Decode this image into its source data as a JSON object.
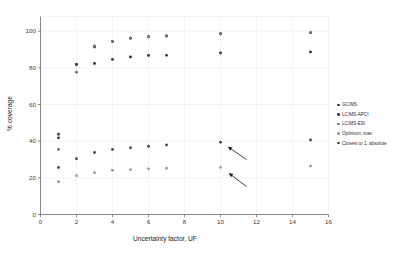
{
  "chart_data": {
    "type": "scatter",
    "title": "",
    "xlabel": "Uncertainty factor, UF",
    "ylabel": "% coverage",
    "xlim": [
      0,
      16
    ],
    "ylim": [
      0,
      108
    ],
    "xticks": [
      0,
      2,
      4,
      6,
      8,
      10,
      12,
      14,
      16
    ],
    "yticks": [
      0,
      20,
      40,
      60,
      80,
      100
    ],
    "grid": true,
    "legend_position": "right",
    "series": [
      {
        "name": "GC/MS",
        "color": "#333333",
        "marker": "circle",
        "x": [
          1,
          2,
          3,
          4,
          5,
          6,
          7,
          10,
          15
        ],
        "y": [
          41.8,
          81.8,
          82.4,
          84.6,
          85.9,
          86.7,
          86.8,
          88.1,
          88.7
        ]
      },
      {
        "name": "LC/MS-APCI",
        "color": "#3d3d3d",
        "marker": "circle",
        "x": [
          1,
          2,
          3,
          4,
          5,
          6,
          7,
          10,
          15
        ],
        "y": [
          43.8,
          81.9,
          91.4,
          94.4,
          96.1,
          97.0,
          97.4,
          98.6,
          99.2
        ]
      },
      {
        "name": "LC/MS-ESI",
        "color": "#6f6f6f",
        "marker": "circle",
        "x": [
          1,
          2,
          3,
          4,
          5,
          6,
          7,
          10,
          15
        ],
        "y": [
          35.5,
          77.6,
          91.9,
          94.4,
          96.1,
          97.0,
          97.4,
          98.6,
          99.2
        ]
      },
      {
        "name": "Optimum, max",
        "color": "#9a9a9a",
        "marker": "circle",
        "x": [
          1,
          2,
          3,
          4,
          5,
          6,
          7,
          10,
          15
        ],
        "y": [
          17.9,
          21.2,
          22.8,
          24.1,
          24.5,
          24.9,
          25.2,
          25.7,
          26.4
        ]
      },
      {
        "name": "Closest to 1, absolute",
        "color": "#4a4a4a",
        "marker": "circle",
        "x": [
          1,
          2,
          3,
          4,
          5,
          6,
          7,
          10,
          15
        ],
        "y": [
          25.6,
          30.4,
          33.8,
          35.5,
          36.4,
          37.2,
          37.9,
          39.4,
          40.6
        ]
      }
    ],
    "annotations": [
      {
        "name": "arrow-upper",
        "type": "arrow",
        "tail_x": 11.45,
        "tail_y": 30.0,
        "head_x": 10.4,
        "head_y": 37.0
      },
      {
        "name": "arrow-lower",
        "type": "arrow",
        "tail_x": 11.45,
        "tail_y": 15.2,
        "head_x": 10.45,
        "head_y": 22.7
      }
    ]
  },
  "legend": {
    "items": [
      {
        "label": "GC/MS",
        "color": "#333333"
      },
      {
        "label": "LC/MS-APCI",
        "color": "#3d3d3d"
      },
      {
        "label": "LC/MS-ESI",
        "color": "#6f6f6f"
      },
      {
        "label": "Optimum, max",
        "color": "#9a9a9a"
      },
      {
        "label": "Closest to 1, absolute",
        "color": "#4a4a4a"
      }
    ]
  },
  "axes": {
    "x_title": "Uncertainty factor, UF",
    "y_title": "% coverage",
    "x_tick_labels": [
      "0",
      "2",
      "4",
      "6",
      "8",
      "10",
      "12",
      "14",
      "16"
    ],
    "y_tick_labels": [
      "0",
      "20",
      "40",
      "60",
      "80",
      "100"
    ]
  },
  "style": {
    "background": "#ffffff",
    "grid_color": "#f2f2f2",
    "axis_color": "#7a7a7a",
    "text_color": "#2b2b2b"
  }
}
